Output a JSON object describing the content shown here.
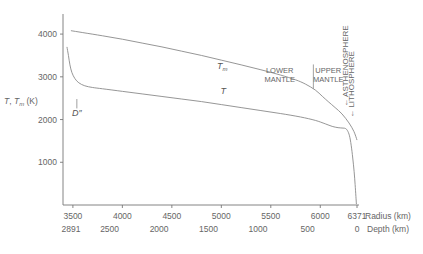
{
  "chart_data": {
    "type": "line",
    "title": "",
    "ylabel": "T, Tm (K)",
    "ylabel_main": "T",
    "ylabel_sep": ", ",
    "ylabel_sub_base": "T",
    "ylabel_sub": "m",
    "ylabel_units": " (K)",
    "ylim": [
      0,
      4400
    ],
    "yticks": [
      1000,
      2000,
      3000,
      4000
    ],
    "ytick_labels": [
      "1000",
      "2000",
      "3000",
      "4000"
    ],
    "grid": false,
    "legend": "none",
    "xaxis_primary": {
      "label": "Radius (km)",
      "ticks": [
        3500,
        4000,
        4500,
        5000,
        5500,
        6000,
        6371
      ],
      "tick_labels": [
        "3500",
        "4000",
        "4500",
        "5000",
        "5500",
        "6000",
        "6371"
      ],
      "xlim": [
        3400,
        6371
      ]
    },
    "xaxis_secondary": {
      "label": "Depth (km)",
      "ticks": [
        2891,
        2500,
        2000,
        1500,
        1000,
        500,
        0
      ],
      "tick_labels": [
        "2891",
        "2500",
        "2000",
        "1500",
        "1000",
        "500",
        "0"
      ]
    },
    "series": [
      {
        "name": "Tm",
        "label": "T",
        "label_sub": "m",
        "label_x": 5010,
        "label_y": 3180,
        "points": [
          [
            3480,
            4080
          ],
          [
            3600,
            4035
          ],
          [
            3800,
            3960
          ],
          [
            4000,
            3880
          ],
          [
            4200,
            3790
          ],
          [
            4400,
            3700
          ],
          [
            4600,
            3600
          ],
          [
            4800,
            3500
          ],
          [
            5000,
            3390
          ],
          [
            5200,
            3280
          ],
          [
            5400,
            3165
          ],
          [
            5600,
            3040
          ],
          [
            5750,
            2930
          ],
          [
            5850,
            2830
          ],
          [
            5950,
            2690
          ],
          [
            6020,
            2545
          ],
          [
            6080,
            2420
          ],
          [
            6150,
            2280
          ],
          [
            6220,
            2130
          ],
          [
            6290,
            1920
          ],
          [
            6340,
            1720
          ],
          [
            6371,
            1520
          ]
        ]
      },
      {
        "name": "T",
        "label": "T",
        "label_sub": "",
        "label_x": 5020,
        "label_y": 2600,
        "points": [
          [
            3440,
            3700
          ],
          [
            3455,
            3500
          ],
          [
            3470,
            3280
          ],
          [
            3490,
            3100
          ],
          [
            3520,
            2960
          ],
          [
            3560,
            2860
          ],
          [
            3620,
            2790
          ],
          [
            3700,
            2750
          ],
          [
            3800,
            2720
          ],
          [
            4000,
            2660
          ],
          [
            4200,
            2600
          ],
          [
            4400,
            2540
          ],
          [
            4600,
            2480
          ],
          [
            4800,
            2420
          ],
          [
            5000,
            2350
          ],
          [
            5200,
            2280
          ],
          [
            5400,
            2210
          ],
          [
            5600,
            2140
          ],
          [
            5800,
            2060
          ],
          [
            5950,
            1980
          ],
          [
            6050,
            1900
          ],
          [
            6120,
            1840
          ],
          [
            6180,
            1810
          ],
          [
            6230,
            1800
          ],
          [
            6255,
            1790
          ],
          [
            6275,
            1740
          ],
          [
            6295,
            1620
          ],
          [
            6312,
            1400
          ],
          [
            6328,
            1100
          ],
          [
            6342,
            780
          ],
          [
            6352,
            480
          ],
          [
            6360,
            200
          ],
          [
            6365,
            20
          ]
        ]
      }
    ],
    "annotations": {
      "dprime": {
        "label": "D″",
        "x": 3540,
        "y": 2160,
        "pointer_top_y": 2480,
        "pointer_bottom_y": 2260
      },
      "lower_mantle": {
        "line1": "LOWER",
        "line2": "MANTLE",
        "x": 5590,
        "y": 3100
      },
      "upper_mantle": {
        "line1": "UPPER",
        "line2": "MANTLE",
        "x": 6080,
        "y": 3100
      },
      "mantle_divider": {
        "x": 5930,
        "y_top": 3290,
        "y_bottom": 2720
      },
      "asthenosphere": {
        "label": "ASTHENOSPHERE",
        "marker": "←",
        "x": 6280,
        "y_bottom": 2300
      },
      "lithosphere": {
        "label": "LITHOSPHERE",
        "marker": "←",
        "x": 6340,
        "y_bottom": 2040
      }
    }
  }
}
